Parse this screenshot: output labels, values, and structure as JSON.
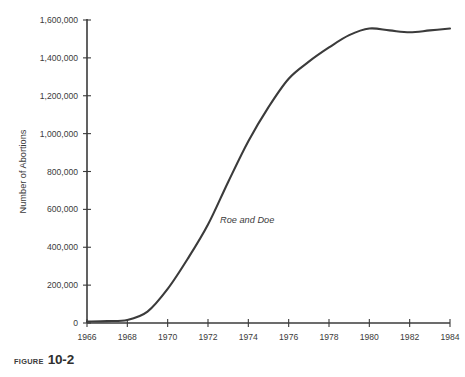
{
  "figure": {
    "caption_word": "Figure",
    "caption_number": "10-2"
  },
  "chart_data": {
    "type": "line",
    "title": "",
    "subtitle": "",
    "xlabel": "",
    "ylabel": "Number of Abortions",
    "xlim": [
      1966,
      1984
    ],
    "ylim": [
      0,
      1600000
    ],
    "grid": false,
    "legend": "none",
    "x_ticks": [
      1966,
      1968,
      1970,
      1972,
      1974,
      1976,
      1978,
      1980,
      1982,
      1984
    ],
    "x_tick_labels": [
      "1966",
      "1968",
      "1970",
      "1972",
      "1974",
      "1976",
      "1978",
      "1980",
      "1982",
      "1984"
    ],
    "y_ticks": [
      0,
      200000,
      400000,
      600000,
      800000,
      1000000,
      1200000,
      1400000,
      1600000
    ],
    "y_tick_labels": [
      "0",
      "200,000",
      "400,000",
      "600,000",
      "800,000",
      "1,000,000",
      "1,200,000",
      "1,400,000",
      "1,600,000"
    ],
    "series": [
      {
        "name": "Number of Abortions",
        "color": "#3b3b3b",
        "x": [
          1966,
          1967,
          1968,
          1969,
          1970,
          1971,
          1972,
          1973,
          1974,
          1975,
          1976,
          1977,
          1978,
          1979,
          1980,
          1981,
          1982,
          1983,
          1984
        ],
        "values": [
          8000,
          10000,
          16000,
          60000,
          180000,
          340000,
          520000,
          745000,
          960000,
          1140000,
          1290000,
          1380000,
          1455000,
          1520000,
          1555000,
          1545000,
          1535000,
          1545000,
          1555000
        ]
      }
    ],
    "annotations": [
      {
        "text": "Roe and Doe",
        "x": 1972.6,
        "y": 530000,
        "style": "italic"
      }
    ]
  }
}
